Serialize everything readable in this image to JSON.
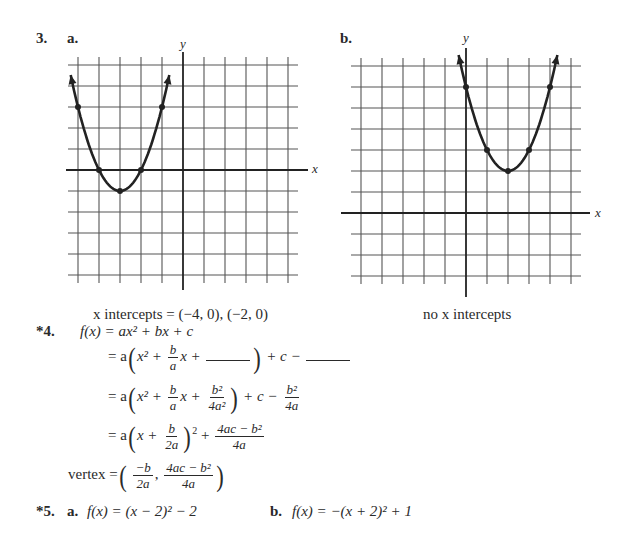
{
  "problem3": {
    "number": "3.",
    "part_a_label": "a.",
    "part_b_label": "b.",
    "axis_x_label": "x",
    "axis_y_label": "y",
    "caption_a": "x intercepts = (−4, 0), (−2, 0)",
    "caption_b": "no x intercepts"
  },
  "problem4": {
    "number": "*4.",
    "line1": "f(x) = ax² + bx + c",
    "line2_prefix": "= a",
    "line2_tail": "+ c −",
    "line3_prefix": "= a",
    "line3_tail": "+ c −",
    "line4_prefix": "= a",
    "line4_tail": "+",
    "vertex_label": "vertex =",
    "frac_b": "b",
    "frac_a": "a",
    "frac_b2": "b²",
    "frac_4a2": "4a²",
    "frac_4a": "4a",
    "frac_2a": "2a",
    "frac_neg_b": "−b",
    "frac_4ac_b2": "4ac − b²",
    "x2_plus": "x² +",
    "x_plus": "x +",
    "x_plus_close": "x +",
    "sq": "2"
  },
  "problem5": {
    "number": "*5.",
    "part_a_label": "a.",
    "part_a_eq": "f(x) = (x − 2)² − 2",
    "part_b_label": "b.",
    "part_b_eq": "f(x) = −(x + 2)² + 1"
  },
  "chart_data": [
    {
      "type": "line",
      "title": "3a",
      "function": "f(x) = (x + 3)² − 1",
      "xlabel": "x",
      "ylabel": "y",
      "xlim": [
        -5,
        5
      ],
      "ylim": [
        -5,
        5
      ],
      "grid": true,
      "points": [
        [
          -5,
          3
        ],
        [
          -4,
          0
        ],
        [
          -3,
          -1
        ],
        [
          -2,
          0
        ],
        [
          -1,
          3
        ]
      ],
      "vertex": [
        -3,
        -1
      ],
      "x_intercepts": [
        [
          -4,
          0
        ],
        [
          -2,
          0
        ]
      ]
    },
    {
      "type": "line",
      "title": "3b",
      "function": "f(x) = (x − 2)² + 2",
      "xlabel": "x",
      "ylabel": "y",
      "xlim": [
        -5,
        5
      ],
      "ylim": [
        -3,
        7
      ],
      "grid": true,
      "points": [
        [
          0,
          6
        ],
        [
          1,
          3
        ],
        [
          2,
          2
        ],
        [
          3,
          3
        ],
        [
          4,
          6
        ]
      ],
      "vertex": [
        2,
        2
      ],
      "x_intercepts": []
    }
  ]
}
